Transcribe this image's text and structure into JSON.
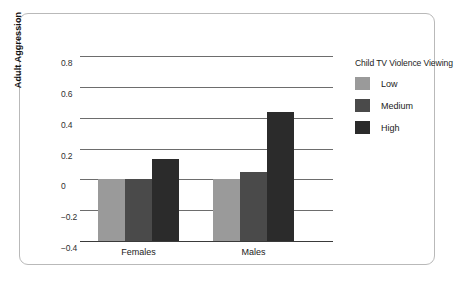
{
  "chart_data": {
    "type": "bar",
    "title": "",
    "xlabel": "",
    "ylabel": "Adult Aggression",
    "categories": [
      "Females",
      "Males"
    ],
    "ylim": [
      -0.4,
      0.8
    ],
    "yticks": [
      "0.8",
      "0.6",
      "0.4",
      "0.2",
      "0",
      "−0.2",
      "−0.4"
    ],
    "ytick_values": [
      0.8,
      0.6,
      0.4,
      0.2,
      0,
      -0.2,
      -0.4
    ],
    "grid": true,
    "legend_position": "right",
    "legend_title": "Child TV Violence Viewing",
    "series": [
      {
        "name": "Low",
        "color": "#9a9a9a",
        "values": [
          -0.15,
          -0.14
        ]
      },
      {
        "name": "Medium",
        "color": "#4a4a4a",
        "values": [
          -0.17,
          0.05
        ]
      },
      {
        "name": "High",
        "color": "#2b2b2b",
        "values": [
          0.13,
          0.44
        ]
      }
    ]
  },
  "axis": {
    "y_title": "Adult Aggression"
  },
  "legend": {
    "title": "Child TV Violence Viewing",
    "items": [
      {
        "label": "Low"
      },
      {
        "label": "Medium"
      },
      {
        "label": "High"
      }
    ]
  }
}
